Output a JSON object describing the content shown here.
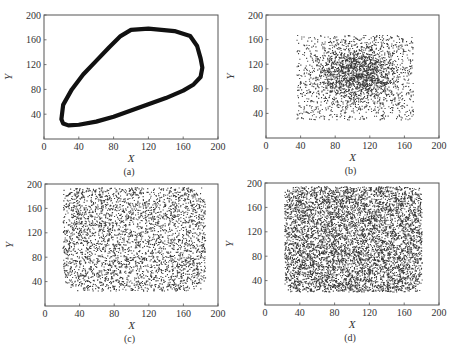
{
  "figure": {
    "panels": [
      {
        "id": "a",
        "caption": "(a)",
        "frame": {
          "x0": 44,
          "y0": 15,
          "x1": 218,
          "y1": 139
        }
      },
      {
        "id": "b",
        "caption": "(b)",
        "frame": {
          "x0": 266,
          "y0": 15,
          "x1": 439,
          "y1": 138
        }
      },
      {
        "id": "c",
        "caption": "(c)",
        "frame": {
          "x0": 45,
          "y0": 184,
          "x1": 218,
          "y1": 306
        }
      },
      {
        "id": "d",
        "caption": "(d)",
        "frame": {
          "x0": 265,
          "y0": 183,
          "x1": 439,
          "y1": 305
        }
      }
    ]
  },
  "chart_data": [
    {
      "panel": "(a)",
      "type": "line",
      "title": "",
      "xlabel": "X",
      "ylabel": "Y",
      "xlim": [
        0,
        200
      ],
      "ylim": [
        0,
        200
      ],
      "xticks": [
        0,
        40,
        80,
        120,
        160,
        200
      ],
      "yticks": [
        40,
        80,
        120,
        160,
        200
      ],
      "grid": false,
      "description": "Closed trajectory loop (thick dense band of points)",
      "x": [
        20,
        22,
        28,
        40,
        60,
        80,
        100,
        120,
        140,
        160,
        172,
        180,
        182,
        180,
        176,
        168,
        150,
        120,
        100,
        88,
        75,
        60,
        45,
        32,
        22,
        20
      ],
      "y": [
        32,
        25,
        22,
        23,
        28,
        36,
        46,
        56,
        66,
        78,
        88,
        100,
        115,
        130,
        150,
        166,
        174,
        178,
        176,
        166,
        148,
        126,
        104,
        80,
        55,
        32
      ]
    },
    {
      "panel": "(b)",
      "type": "scatter",
      "title": "",
      "xlabel": "X",
      "ylabel": "Y",
      "xlim": [
        0,
        200
      ],
      "ylim": [
        0,
        200
      ],
      "xticks": [
        0,
        40,
        80,
        120,
        160,
        200
      ],
      "yticks": [
        40,
        80,
        120,
        160,
        200
      ],
      "grid": false,
      "description": "Scattered points, densest near center",
      "x_range": [
        35,
        170
      ],
      "y_range": [
        30,
        168
      ],
      "dense_center": [
        105,
        105
      ],
      "n_points": 2600
    },
    {
      "panel": "(c)",
      "type": "scatter",
      "title": "",
      "xlabel": "X",
      "ylabel": "Y",
      "xlim": [
        0,
        200
      ],
      "ylim": [
        0,
        200
      ],
      "xticks": [
        0,
        40,
        80,
        120,
        160,
        200
      ],
      "yticks": [
        40,
        80,
        120,
        160,
        200
      ],
      "grid": false,
      "description": "Scattered points spread across rectangle",
      "x_range": [
        20,
        185
      ],
      "y_range": [
        25,
        195
      ],
      "n_points": 3400
    },
    {
      "panel": "(d)",
      "type": "scatter",
      "title": "",
      "xlabel": "X",
      "ylabel": "Y",
      "xlim": [
        0,
        200
      ],
      "ylim": [
        0,
        200
      ],
      "xticks": [
        0,
        40,
        80,
        120,
        160,
        200
      ],
      "yticks": [
        40,
        80,
        120,
        160,
        200
      ],
      "grid": false,
      "description": "Very dense uniform scatter across rectangle",
      "x_range": [
        22,
        180
      ],
      "y_range": [
        22,
        195
      ],
      "n_points": 6000
    }
  ]
}
